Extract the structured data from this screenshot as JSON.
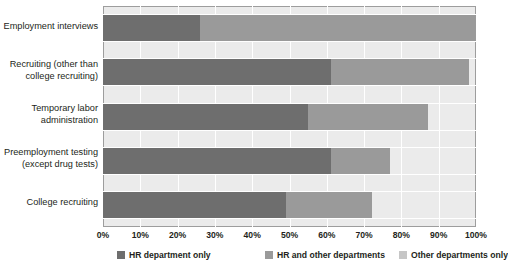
{
  "chart_data": {
    "type": "bar",
    "orientation": "horizontal",
    "stacked": true,
    "title": "",
    "subtitle": "",
    "xlabel": "",
    "ylabel": "",
    "xlim": [
      0,
      100
    ],
    "xticks": [
      0,
      10,
      20,
      30,
      40,
      50,
      60,
      70,
      80,
      90,
      100
    ],
    "xtick_labels": [
      "0%",
      "10%",
      "20%",
      "30%",
      "40%",
      "50%",
      "60%",
      "70%",
      "80%",
      "90%",
      "100%"
    ],
    "grid": true,
    "grid_axis": "both",
    "legend_position": "bottom",
    "categories": [
      "Employment interviews",
      "Recruiting (other than college recruiting)",
      "Temporary labor administration",
      "Preemployment testing (except drug tests)",
      "College recruiting"
    ],
    "category_lines": [
      [
        "Employment interviews"
      ],
      [
        "Recruiting (other than",
        "college recruiting)"
      ],
      [
        "Temporary labor",
        "administration"
      ],
      [
        "Preemployment testing",
        "(except drug tests)"
      ],
      [
        "College recruiting"
      ]
    ],
    "series": [
      {
        "name": "HR department only",
        "color": "#6e6e6e",
        "values": [
          26,
          61,
          55,
          61,
          49
        ]
      },
      {
        "name": "HR and other departments",
        "color": "#9a9a9a",
        "values": [
          74,
          37,
          32,
          16,
          23
        ]
      },
      {
        "name": "Other departments only",
        "color": "#c6c6c6",
        "values": [
          0,
          0,
          0,
          0,
          0
        ]
      }
    ],
    "totals": [
      100,
      98,
      87,
      77,
      72
    ]
  },
  "colors": {
    "series_1": "#6e6e6e",
    "series_2": "#9a9a9a",
    "series_3": "#c6c6c6",
    "plot_background": "#ebebeb",
    "gridline": "#ffffff",
    "axis_border": "#9d9d9d",
    "text": "#231f20"
  },
  "legend": {
    "items": [
      {
        "label": "HR department only",
        "color": "#6e6e6e"
      },
      {
        "label": "HR and other departments",
        "color": "#9a9a9a"
      },
      {
        "label": "Other departments only",
        "color": "#c6c6c6"
      }
    ]
  }
}
